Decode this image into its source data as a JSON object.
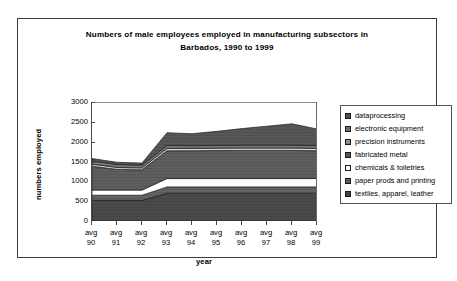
{
  "chart_data": {
    "type": "area",
    "stacked": true,
    "title": "Numbers of male employees employed in manufacturing subsectors in Barbados, 1990 to 1999",
    "title_line1": "Numbers of male employees employed in manufacturing subsectors in",
    "title_line2": "Barbados, 1990 to 1999",
    "xlabel": "year",
    "ylabel": "numbers employed",
    "ylim": [
      0,
      3000
    ],
    "yticks": [
      0,
      500,
      1000,
      1500,
      2000,
      2500,
      3000
    ],
    "ytick_labels": [
      "0",
      "500",
      "1000",
      "1500",
      "2000",
      "2500",
      "3000"
    ],
    "grid": false,
    "legend_position": "right",
    "categories": [
      "avg 90",
      "avg 91",
      "avg 92",
      "avg 93",
      "avg 94",
      "avg 95",
      "avg 96",
      "avg 97",
      "avg 98",
      "avg 99"
    ],
    "category_top_labels": [
      "avg",
      "avg",
      "avg",
      "avg",
      "avg",
      "avg",
      "avg",
      "avg",
      "avg",
      "avg"
    ],
    "category_bottom_labels": [
      "90",
      "91",
      "92",
      "93",
      "94",
      "95",
      "96",
      "97",
      "98",
      "99"
    ],
    "series": [
      {
        "name": "textiles, apparel, leather",
        "color": "#4a4a4a",
        "pattern": "solid-dark",
        "values": [
          520,
          520,
          520,
          700,
          700,
          700,
          700,
          700,
          700,
          700
        ]
      },
      {
        "name": "paper prods and printing",
        "color": "#636363",
        "pattern": "solid-mid-dark",
        "values": [
          130,
          130,
          130,
          160,
          160,
          160,
          160,
          160,
          160,
          160
        ]
      },
      {
        "name": "chemicals & toiletries",
        "color": "#ffffff",
        "pattern": "white",
        "values": [
          130,
          130,
          130,
          210,
          210,
          210,
          210,
          210,
          210,
          210
        ]
      },
      {
        "name": "fabricated metal",
        "color": "#5e5e5e",
        "pattern": "solid-mid",
        "values": [
          600,
          520,
          510,
          700,
          700,
          705,
          710,
          710,
          710,
          700
        ]
      },
      {
        "name": "precision instruments",
        "color": "#d4d4d4",
        "pattern": "light",
        "values": [
          55,
          50,
          50,
          60,
          60,
          60,
          60,
          60,
          60,
          60
        ]
      },
      {
        "name": "electronic equipment",
        "color": "#7a7a7a",
        "pattern": "solid-grey",
        "values": [
          80,
          75,
          70,
          75,
          70,
          70,
          70,
          70,
          70,
          70
        ]
      },
      {
        "name": "dataprocessing",
        "color": "#575757",
        "pattern": "solid-dark2",
        "values": [
          60,
          55,
          50,
          320,
          300,
          355,
          420,
          480,
          540,
          420
        ]
      }
    ],
    "legend_entries": [
      {
        "label": "dataprocessing",
        "color": "#575757"
      },
      {
        "label": "electronic equipment",
        "color": "#7a7a7a"
      },
      {
        "label": "precision instruments",
        "color": "#9a9a9a"
      },
      {
        "label": "fabricated metal",
        "color": "#5e5e5e"
      },
      {
        "label": "chemicals & toiletries",
        "color": "#ffffff"
      },
      {
        "label": "paper prods and printing",
        "color": "#636363"
      },
      {
        "label": "textiles, apparel, leather",
        "color": "#4a4a4a"
      }
    ],
    "stack_totals": [
      1575,
      1480,
      1460,
      2225,
      2200,
      2260,
      2330,
      2390,
      2450,
      2320
    ]
  }
}
